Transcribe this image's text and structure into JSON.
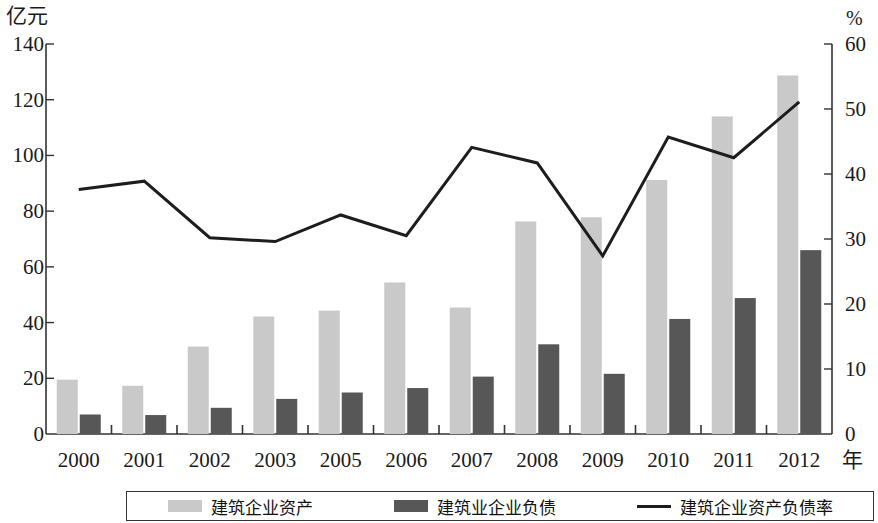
{
  "axes": {
    "left_unit": "亿元",
    "right_unit": "%",
    "x_unit": "年",
    "left_ticks": [
      "0",
      "20",
      "40",
      "60",
      "80",
      "100",
      "120",
      "140"
    ],
    "right_ticks": [
      "0",
      "10",
      "20",
      "30",
      "40",
      "50",
      "60"
    ]
  },
  "legend": {
    "items": [
      {
        "label": "建筑企业资产",
        "marker": "bar",
        "color": "#c9c9c9"
      },
      {
        "label": "建筑业企业负债",
        "marker": "bar",
        "color": "#575757"
      },
      {
        "label": "建筑企业资产负债率",
        "marker": "line",
        "color": "#1d1d1d"
      }
    ]
  },
  "chart_data": {
    "type": "bar",
    "title": "",
    "xlabel": "年",
    "ylabel": "亿元",
    "y2label": "%",
    "ylim": [
      0,
      140
    ],
    "y2lim": [
      0,
      60
    ],
    "grid": false,
    "legend_position": "bottom",
    "categories": [
      "2000",
      "2001",
      "2002",
      "2003",
      "2005",
      "2006",
      "2007",
      "2008",
      "2009",
      "2010",
      "2011",
      "2012"
    ],
    "series": [
      {
        "name": "建筑企业资产",
        "type": "bar",
        "axis": "left",
        "color": "#c9c9c9",
        "values": [
          19.5,
          17.3,
          31.4,
          42.2,
          44.3,
          54.4,
          45.4,
          76.3,
          77.8,
          91.2,
          114.0,
          128.7
        ]
      },
      {
        "name": "建筑业企业负债",
        "type": "bar",
        "axis": "left",
        "color": "#575757",
        "values": [
          7.0,
          6.8,
          9.4,
          12.6,
          14.9,
          16.5,
          20.6,
          32.2,
          21.6,
          41.3,
          48.8,
          66.0
        ]
      },
      {
        "name": "建筑企业资产负债率",
        "type": "line",
        "axis": "right",
        "color": "#1d1d1d",
        "values": [
          37.6,
          38.9,
          30.2,
          29.6,
          33.7,
          30.5,
          44.1,
          41.7,
          27.4,
          45.7,
          42.5,
          51.1
        ]
      }
    ]
  }
}
